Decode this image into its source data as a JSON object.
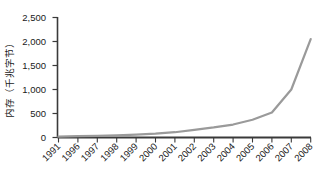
{
  "chart_data": {
    "type": "line",
    "title": "",
    "xlabel": "",
    "ylabel": "内存（千兆字节）",
    "categories": [
      "1991",
      "1996",
      "1997",
      "1998",
      "1999",
      "2000",
      "2001",
      "2002",
      "2003",
      "2004",
      "2005",
      "2006",
      "2007",
      "2008"
    ],
    "values": [
      20,
      30,
      35,
      45,
      60,
      80,
      110,
      160,
      210,
      270,
      370,
      520,
      1000,
      2050
    ],
    "ylim": [
      0,
      2500
    ],
    "ytick_labels": [
      "0",
      "500",
      "1,000",
      "1,500",
      "2,000",
      "2,500"
    ],
    "ytick_values": [
      0,
      500,
      1000,
      1500,
      2000,
      2500
    ],
    "grid": false,
    "legend": "none",
    "series": [
      {
        "name": "内存",
        "color": "#9a9a9a",
        "values": [
          20,
          30,
          35,
          45,
          60,
          80,
          110,
          160,
          210,
          270,
          370,
          520,
          1000,
          2050
        ]
      }
    ]
  },
  "axes": {
    "y_title": "内存（千兆字节）",
    "ytick_0": "0",
    "ytick_1": "500",
    "ytick_2": "1,000",
    "ytick_3": "1,500",
    "ytick_4": "2,000",
    "ytick_5": "2,500",
    "xtick_0": "1991",
    "xtick_1": "1996",
    "xtick_2": "1997",
    "xtick_3": "1998",
    "xtick_4": "1999",
    "xtick_5": "2000",
    "xtick_6": "2001",
    "xtick_7": "2002",
    "xtick_8": "2003",
    "xtick_9": "2004",
    "xtick_10": "2005",
    "xtick_11": "2006",
    "xtick_12": "2007",
    "xtick_13": "2008"
  },
  "colors": {
    "line": "#9a9a9a",
    "axis": "#3a3a3a",
    "text": "#1a1a1a",
    "background": "#ffffff"
  }
}
